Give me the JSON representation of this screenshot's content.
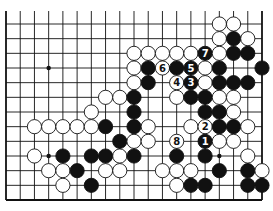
{
  "diagram": {
    "type": "go-board-fragment",
    "columns": [
      "A",
      "B",
      "C",
      "D",
      "E",
      "F",
      "G",
      "H",
      "J",
      "K",
      "L",
      "M",
      "N",
      "O",
      "P",
      "Q",
      "R",
      "S",
      "T"
    ],
    "rows_visible": [
      1,
      2,
      3,
      4,
      5,
      6,
      7,
      8,
      9,
      10,
      11,
      12,
      13
    ],
    "edges": {
      "left": true,
      "right": true,
      "bottom": true,
      "top": false
    },
    "colors": {
      "black": "#111111",
      "white": "#ffffff",
      "line": "#111111",
      "background": "#ffffff"
    },
    "star_points": [
      "D10",
      "D4",
      "Q4"
    ],
    "stones": [
      {
        "pt": "Q13",
        "c": "W"
      },
      {
        "pt": "R13",
        "c": "W"
      },
      {
        "pt": "Q12",
        "c": "W"
      },
      {
        "pt": "R12",
        "c": "B"
      },
      {
        "pt": "S12",
        "c": "W"
      },
      {
        "pt": "K11",
        "c": "W"
      },
      {
        "pt": "L11",
        "c": "W"
      },
      {
        "pt": "M11",
        "c": "W"
      },
      {
        "pt": "N11",
        "c": "W"
      },
      {
        "pt": "O11",
        "c": "W"
      },
      {
        "pt": "P11",
        "c": "B",
        "n": "7"
      },
      {
        "pt": "Q11",
        "c": "W"
      },
      {
        "pt": "R11",
        "c": "B"
      },
      {
        "pt": "S11",
        "c": "B"
      },
      {
        "pt": "K10",
        "c": "W"
      },
      {
        "pt": "L10",
        "c": "B"
      },
      {
        "pt": "M10",
        "c": "W",
        "n": "6"
      },
      {
        "pt": "N10",
        "c": "B"
      },
      {
        "pt": "O10",
        "c": "B",
        "n": "5"
      },
      {
        "pt": "P10",
        "c": "W"
      },
      {
        "pt": "Q10",
        "c": "B"
      },
      {
        "pt": "T10",
        "c": "B"
      },
      {
        "pt": "K9",
        "c": "W"
      },
      {
        "pt": "L9",
        "c": "B"
      },
      {
        "pt": "N9",
        "c": "W",
        "n": "4"
      },
      {
        "pt": "O9",
        "c": "B",
        "n": "3"
      },
      {
        "pt": "P9",
        "c": "W"
      },
      {
        "pt": "Q9",
        "c": "B"
      },
      {
        "pt": "R9",
        "c": "B"
      },
      {
        "pt": "S9",
        "c": "B"
      },
      {
        "pt": "H8",
        "c": "W"
      },
      {
        "pt": "J8",
        "c": "W"
      },
      {
        "pt": "K8",
        "c": "B"
      },
      {
        "pt": "N8",
        "c": "W"
      },
      {
        "pt": "O8",
        "c": "B"
      },
      {
        "pt": "P8",
        "c": "B"
      },
      {
        "pt": "Q8",
        "c": "W"
      },
      {
        "pt": "R8",
        "c": "W"
      },
      {
        "pt": "G7",
        "c": "W"
      },
      {
        "pt": "K7",
        "c": "B"
      },
      {
        "pt": "P7",
        "c": "B"
      },
      {
        "pt": "Q7",
        "c": "B"
      },
      {
        "pt": "R7",
        "c": "W"
      },
      {
        "pt": "C6",
        "c": "W"
      },
      {
        "pt": "D6",
        "c": "W"
      },
      {
        "pt": "E6",
        "c": "W"
      },
      {
        "pt": "F6",
        "c": "W"
      },
      {
        "pt": "G6",
        "c": "W"
      },
      {
        "pt": "H6",
        "c": "B"
      },
      {
        "pt": "K6",
        "c": "B"
      },
      {
        "pt": "L6",
        "c": "W"
      },
      {
        "pt": "O6",
        "c": "W"
      },
      {
        "pt": "P6",
        "c": "W",
        "n": "2"
      },
      {
        "pt": "Q6",
        "c": "B"
      },
      {
        "pt": "R6",
        "c": "B"
      },
      {
        "pt": "S6",
        "c": "W"
      },
      {
        "pt": "J5",
        "c": "B"
      },
      {
        "pt": "K5",
        "c": "W"
      },
      {
        "pt": "L5",
        "c": "W"
      },
      {
        "pt": "N5",
        "c": "W",
        "n": "8"
      },
      {
        "pt": "P5",
        "c": "B",
        "n": "1"
      },
      {
        "pt": "Q5",
        "c": "W"
      },
      {
        "pt": "R5",
        "c": "W"
      },
      {
        "pt": "C4",
        "c": "W"
      },
      {
        "pt": "E4",
        "c": "B"
      },
      {
        "pt": "G4",
        "c": "B"
      },
      {
        "pt": "H4",
        "c": "B"
      },
      {
        "pt": "J4",
        "c": "W"
      },
      {
        "pt": "K4",
        "c": "B"
      },
      {
        "pt": "N4",
        "c": "B"
      },
      {
        "pt": "P4",
        "c": "B"
      },
      {
        "pt": "S4",
        "c": "W"
      },
      {
        "pt": "D3",
        "c": "W"
      },
      {
        "pt": "E3",
        "c": "W"
      },
      {
        "pt": "F3",
        "c": "B"
      },
      {
        "pt": "H3",
        "c": "W"
      },
      {
        "pt": "J3",
        "c": "W"
      },
      {
        "pt": "M3",
        "c": "W"
      },
      {
        "pt": "N3",
        "c": "W"
      },
      {
        "pt": "O3",
        "c": "W"
      },
      {
        "pt": "Q3",
        "c": "B"
      },
      {
        "pt": "S3",
        "c": "B"
      },
      {
        "pt": "T3",
        "c": "W"
      },
      {
        "pt": "E2",
        "c": "W"
      },
      {
        "pt": "G2",
        "c": "B"
      },
      {
        "pt": "N2",
        "c": "W"
      },
      {
        "pt": "O2",
        "c": "B"
      },
      {
        "pt": "P2",
        "c": "B"
      },
      {
        "pt": "S2",
        "c": "B"
      },
      {
        "pt": "T2",
        "c": "B"
      }
    ],
    "move_labels": [
      "1",
      "2",
      "3",
      "4",
      "5",
      "6",
      "7",
      "8"
    ]
  }
}
